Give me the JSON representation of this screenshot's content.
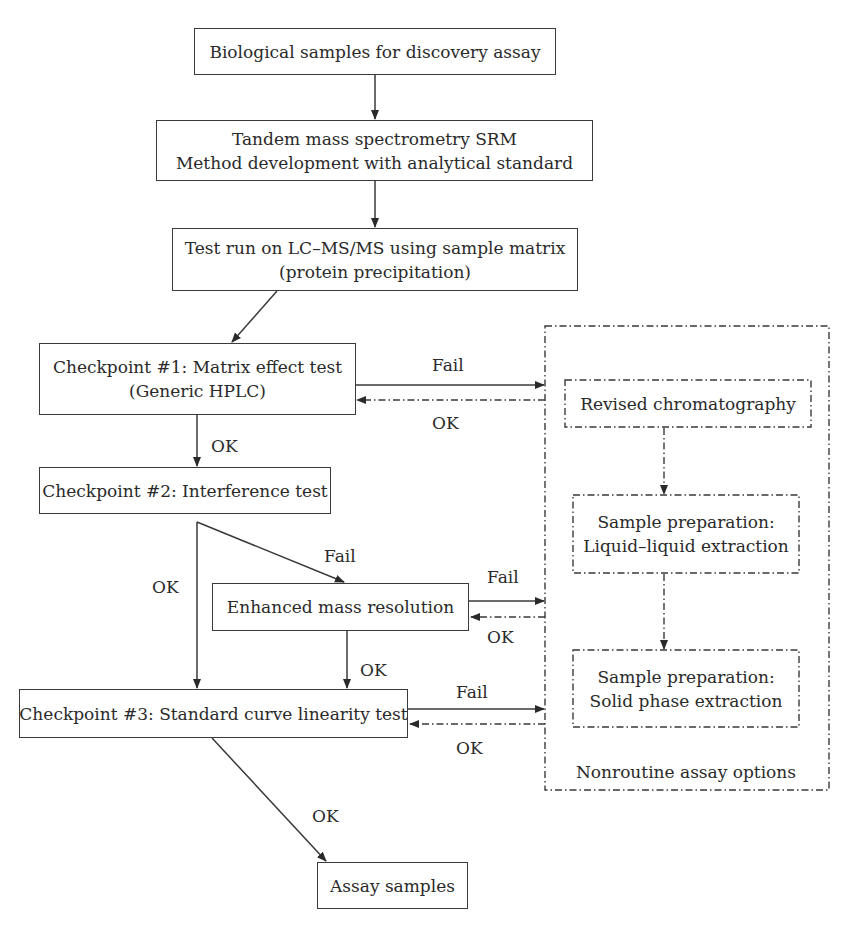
{
  "diagram": {
    "nodes": {
      "biological_samples": {
        "lines": [
          "Biological samples for discovery assay"
        ]
      },
      "tandem_ms": {
        "lines": [
          "Tandem mass spectrometry SRM",
          "Method development with analytical standard"
        ]
      },
      "test_run": {
        "lines": [
          "Test run on LC–MS/MS using sample matrix",
          "(protein precipitation)"
        ]
      },
      "checkpoint1": {
        "lines": [
          "Checkpoint #1: Matrix effect test",
          "(Generic HPLC)"
        ]
      },
      "checkpoint2": {
        "lines": [
          "Checkpoint #2: Interference test"
        ]
      },
      "enhanced_mass": {
        "lines": [
          "Enhanced mass resolution"
        ]
      },
      "checkpoint3": {
        "lines": [
          "Checkpoint #3: Standard curve linearity test"
        ]
      },
      "assay_samples": {
        "lines": [
          "Assay samples"
        ]
      },
      "revised_chrom": {
        "lines": [
          "Revised chromatography"
        ]
      },
      "lle": {
        "lines": [
          "Sample preparation:",
          "Liquid–liquid extraction"
        ]
      },
      "spe": {
        "lines": [
          "Sample preparation:",
          "Solid phase extraction"
        ]
      },
      "nonroutine_group": {
        "title": "Nonroutine assay options"
      }
    },
    "edge_labels": {
      "cp1_fail": "Fail",
      "cp1_ok_return": "OK",
      "cp1_ok_down": "OK",
      "cp2_fail": "Fail",
      "cp2_ok": "OK",
      "enh_fail": "Fail",
      "enh_ok_return": "OK",
      "enh_ok_down": "OK",
      "cp3_fail": "Fail",
      "cp3_ok_return": "OK",
      "cp3_ok_down": "OK"
    },
    "colors": {
      "stroke": "#3a3a3a",
      "text": "#2a2a2a",
      "background": "#ffffff"
    }
  }
}
